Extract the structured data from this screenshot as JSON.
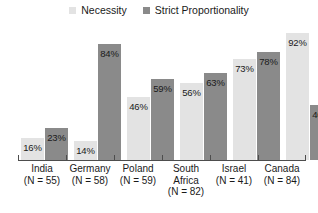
{
  "chart_data": {
    "type": "bar",
    "title": "",
    "subtitle": "",
    "xlabel": "",
    "ylabel": "",
    "ylim": [
      0,
      100
    ],
    "grid": false,
    "legend_position": "top-center",
    "categories": [
      "India",
      "Germany",
      "Poland",
      "South\nAfrica",
      "Israel",
      "Canada"
    ],
    "category_sublabels": [
      "(N = 55)",
      "(N = 58)",
      "(N = 59)",
      "(N = 82)",
      "(N = 41)",
      "(N = 84)"
    ],
    "series": [
      {
        "name": "Necessity",
        "color": "#e3e3e3",
        "values": [
          16,
          14,
          46,
          56,
          73,
          92
        ],
        "value_labels": [
          "16%",
          "14%",
          "46%",
          "56%",
          "73%",
          "92%"
        ]
      },
      {
        "name": "Strict Proportionality",
        "color": "#8a8a8a",
        "values": [
          23,
          84,
          59,
          63,
          78,
          40
        ],
        "value_labels": [
          "23%",
          "84%",
          "59%",
          "63%",
          "78%",
          "40%"
        ]
      }
    ]
  },
  "legend": {
    "items": [
      {
        "label": "Necessity",
        "color": "#e3e3e3"
      },
      {
        "label": "Strict Proportionality",
        "color": "#8a8a8a"
      }
    ]
  },
  "axis": {
    "baseline_color": "#4d4d4d"
  }
}
